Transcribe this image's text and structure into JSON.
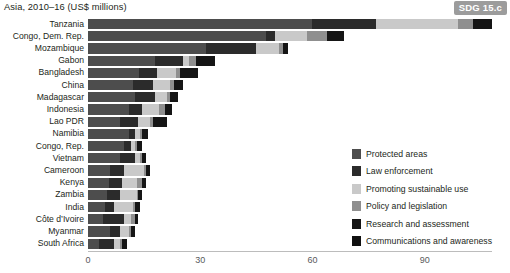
{
  "header": {
    "title": "Asia, 2010–16 (US$ millions)",
    "badge": "SDG 15.c"
  },
  "legend": {
    "position": "bottom-right",
    "items": [
      {
        "label": "Protected areas",
        "color": "#4d4d4d"
      },
      {
        "label": "Law enforcement",
        "color": "#2b2b2b"
      },
      {
        "label": "Promoting sustainable use",
        "color": "#c9c9c9"
      },
      {
        "label": "Policy and legislation",
        "color": "#8f8f8f"
      },
      {
        "label": "Research and assessment",
        "color": "#151515"
      },
      {
        "label": "Communications and awareness",
        "color": "#101010"
      }
    ]
  },
  "axis": {
    "ticks": [
      "0",
      "30",
      "60",
      "90"
    ],
    "tick_values": [
      0,
      30,
      60,
      90
    ],
    "xmin": 0,
    "xmax": 108
  },
  "chart_data": {
    "type": "bar",
    "orientation": "horizontal",
    "stacked": true,
    "title": "Asia, 2010–16 (US$ millions)",
    "xlabel": "",
    "ylabel": "",
    "xlim": [
      0,
      108
    ],
    "grid": false,
    "legend_position": "bottom-right",
    "series": [
      {
        "name": "Protected areas",
        "color": "#4d4d4d",
        "values": [
          60.0,
          47.5,
          31.5,
          18.0,
          13.5,
          12.0,
          12.5,
          11.0,
          8.5,
          11.0,
          9.5,
          8.5,
          6.0,
          5.5,
          5.0,
          4.5,
          4.0,
          6.0,
          3.0
        ]
      },
      {
        "name": "Law enforcement",
        "color": "#2b2b2b",
        "values": [
          17.0,
          2.5,
          13.5,
          7.5,
          5.0,
          5.5,
          5.5,
          3.5,
          5.0,
          1.5,
          2.0,
          4.0,
          3.5,
          3.5,
          3.5,
          2.5,
          5.5,
          2.5,
          4.0
        ]
      },
      {
        "name": "Promoting sustainable use",
        "color": "#c9c9c9",
        "values": [
          22.0,
          8.5,
          6.0,
          1.5,
          5.0,
          4.5,
          3.0,
          4.5,
          3.0,
          1.5,
          1.0,
          1.5,
          5.5,
          4.0,
          4.5,
          5.0,
          2.0,
          2.5,
          1.5
        ]
      },
      {
        "name": "Policy and legislation",
        "color": "#8f8f8f",
        "values": [
          4.0,
          5.5,
          1.0,
          2.0,
          1.0,
          1.0,
          1.0,
          1.5,
          1.0,
          0.5,
          0.5,
          0.5,
          0.5,
          1.5,
          0.5,
          0.5,
          1.0,
          0.5,
          0.5
        ]
      },
      {
        "name": "Research and assessment",
        "color": "#151515",
        "values": [
          5.0,
          4.5,
          1.5,
          5.0,
          5.0,
          2.5,
          2.0,
          2.0,
          3.5,
          1.5,
          1.5,
          1.0,
          1.0,
          1.0,
          1.0,
          1.5,
          1.0,
          1.0,
          1.5
        ]
      },
      {
        "name": "Communications and awareness",
        "color": "#101010",
        "values": [
          0.0,
          0.0,
          0.0,
          0.0,
          0.0,
          0.0,
          0.0,
          0.0,
          0.0,
          0.0,
          0.0,
          0.0,
          0.0,
          0.0,
          0.0,
          0.0,
          0.0,
          0.0,
          0.0
        ]
      }
    ],
    "categories": [
      "Tanzania",
      "Congo, Dem. Rep.",
      "Mozambique",
      "Gabon",
      "Bangladesh",
      "China",
      "Madagascar",
      "Indonesia",
      "Lao PDR",
      "Namibia",
      "Congo, Rep.",
      "Vietnam",
      "Cameroon",
      "Kenya",
      "Zambia",
      "India",
      "Côte d’Ivoire",
      "Myanmar",
      "South Africa"
    ],
    "totals": [
      108.0,
      68.5,
      53.5,
      34.0,
      29.5,
      25.5,
      24.0,
      22.5,
      21.0,
      16.0,
      14.5,
      15.5,
      16.5,
      15.5,
      14.5,
      14.0,
      13.5,
      12.5,
      10.5
    ]
  }
}
